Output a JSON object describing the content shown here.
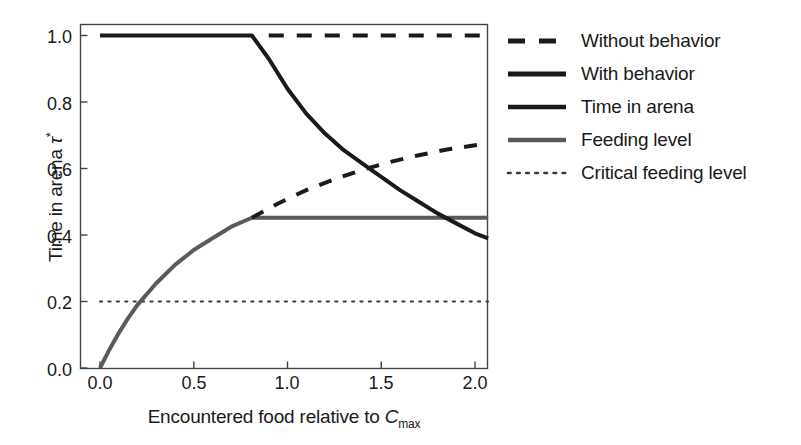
{
  "chart_data": {
    "type": "line",
    "title": "",
    "xlabel": "Encountered food relative to C_max",
    "ylabel": "Time in arena τ*",
    "xlim": [
      0.0,
      2.07
    ],
    "ylim": [
      -0.02,
      1.03
    ],
    "xticks": [
      "0.0",
      "0.5",
      "1.0",
      "1.5",
      "2.0"
    ],
    "xtick_values": [
      0.0,
      0.5,
      1.0,
      1.5,
      2.0
    ],
    "yticks": [
      "0.0",
      "0.2",
      "0.4",
      "0.6",
      "0.8",
      "1.0"
    ],
    "ytick_values": [
      0.0,
      0.2,
      0.4,
      0.6,
      0.8,
      1.0
    ],
    "grid": false,
    "legend_position": "right",
    "series": [
      {
        "name": "Without behavior",
        "style": "dashed",
        "color": "#1a1a1a",
        "width": 4,
        "x": [
          0.0,
          0.2,
          0.4,
          0.6,
          0.81,
          0.9,
          1.0,
          1.1,
          1.2,
          1.3,
          1.4,
          1.5,
          1.6,
          1.7,
          1.8,
          1.9,
          2.0,
          2.07
        ],
        "y": [
          1.0,
          1.0,
          1.0,
          1.0,
          1.0,
          1.0,
          1.0,
          1.0,
          1.0,
          1.0,
          1.0,
          1.0,
          1.0,
          1.0,
          1.0,
          1.0,
          1.0,
          1.0
        ],
        "note": "flat at 1.0 across full range; drawn dashed from x=0.81 to 2.07"
      },
      {
        "name": "With behavior",
        "style": "solid",
        "color": "#1a1a1a",
        "width": 4,
        "x": [
          0.0,
          0.2,
          0.4,
          0.6,
          0.81,
          0.9,
          1.0,
          1.1,
          1.2,
          1.3,
          1.4,
          1.5,
          1.6,
          1.7,
          1.8,
          1.9,
          2.0,
          2.07
        ],
        "y": [
          1.0,
          1.0,
          1.0,
          1.0,
          1.0,
          0.93,
          0.84,
          0.765,
          0.705,
          0.655,
          0.615,
          0.575,
          0.535,
          0.5,
          0.465,
          0.435,
          0.405,
          0.39
        ]
      },
      {
        "name": "Time in arena",
        "style": "solid",
        "color": "#1a1a1a",
        "width": 4,
        "note": "same curve family as With behavior; legend entry only"
      },
      {
        "name": "Feeding level",
        "style": "solid",
        "color": "#5a5a5a",
        "width": 4,
        "x": [
          0.0,
          0.05,
          0.1,
          0.15,
          0.2,
          0.3,
          0.4,
          0.5,
          0.6,
          0.7,
          0.81,
          1.0,
          1.2,
          1.4,
          1.6,
          1.8,
          2.0,
          2.07
        ],
        "y": [
          0.0,
          0.055,
          0.105,
          0.15,
          0.19,
          0.255,
          0.31,
          0.355,
          0.39,
          0.425,
          0.452,
          0.452,
          0.452,
          0.452,
          0.452,
          0.452,
          0.452,
          0.452
        ]
      },
      {
        "name": "Critical feeding level",
        "style": "dotted",
        "color": "#3a3a3a",
        "width": 2,
        "x": [
          0.0,
          2.07
        ],
        "y": [
          0.2,
          0.2
        ],
        "note": "horizontal reference line at 0.2"
      }
    ],
    "annotations": []
  },
  "axes": {
    "y_label_text": "Time in arena ",
    "y_label_symbol": "τ",
    "y_label_sup": "*",
    "x_label_text": "Encountered food relative to ",
    "x_label_symbol": "C",
    "x_label_sub": "max"
  },
  "legend": {
    "items": [
      {
        "label": "Without behavior",
        "style": "dashed",
        "color": "#1a1a1a"
      },
      {
        "label": "With behavior",
        "style": "solid",
        "color": "#1a1a1a"
      },
      {
        "label": "Time in arena",
        "style": "solid",
        "color": "#1a1a1a"
      },
      {
        "label": "Feeding level",
        "style": "solid",
        "color": "#5a5a5a"
      },
      {
        "label": "Critical feeding level",
        "style": "dotted",
        "color": "#3a3a3a"
      }
    ]
  }
}
